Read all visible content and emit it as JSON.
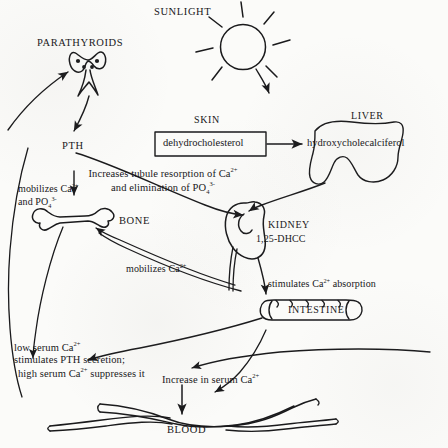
{
  "diagram": {
    "ink_color": "#1a1a1c",
    "background_color": "#fbfbf9"
  },
  "nodes": {
    "sunlight": "SUNLIGHT",
    "parathyroids": "PARATHYROIDS",
    "skin": "SKIN",
    "liver": "LIVER",
    "pth": "PTH",
    "bone": "BONE",
    "kidney": "KIDNEY",
    "intestine": "INTESTINE",
    "blood": "BLOOD"
  },
  "boxes": {
    "dehydrocholesterol": "dehydrocholesterol",
    "hydroxycholecalciferol": "hydroxycholecalciferol",
    "dhcc": "1,25-DHCC"
  },
  "annotations": {
    "tubule_line1": "Increases tubule resorption of Ca",
    "tubule_line1_sup": "2+",
    "tubule_line2_a": "and elimination of PO",
    "tubule_line2_sub": "4",
    "tubule_line2_sup": "3-",
    "mobilizes_pth_line1": "mobilizes Ca",
    "mobilizes_pth_line1_sup": "2+",
    "mobilizes_pth_line2_a": "and  PO",
    "mobilizes_pth_line2_sub": "4",
    "mobilizes_pth_line2_sup": "3-",
    "mobilizes_dhcc": "mobilizes Ca",
    "mobilizes_dhcc_sup": "2+",
    "stimulates_absorption_a": "stimulates  Ca",
    "stimulates_absorption_sup": "2+",
    "stimulates_absorption_b": " absorption",
    "feedback_line1_a": "low serum  Ca",
    "feedback_line1_sup": "2+",
    "feedback_line2": "stimulates PTH secretion;",
    "feedback_line3_a": "high serum  Ca",
    "feedback_line3_sup": "2+",
    "feedback_line3_b": " suppresses it",
    "increase_serum_a": "Increase in serum Ca",
    "increase_serum_sup": "2+"
  },
  "icons": {
    "sun": "sun-icon",
    "parathyroid_gland": "parathyroid-gland-icon",
    "bone": "bone-icon",
    "kidney": "kidney-icon",
    "liver": "liver-icon",
    "intestine": "intestine-icon",
    "blood_vessel": "blood-vessel-icon"
  }
}
